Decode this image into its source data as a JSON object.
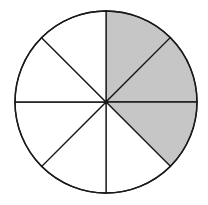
{
  "diagram": {
    "type": "fraction-circle",
    "total_slices": 8,
    "shaded_slices": 3,
    "shaded_indices": [
      0,
      1,
      2
    ],
    "fraction_shown": "3/8",
    "colors": {
      "shaded": "#c6c6c6",
      "unshaded": "#ffffff",
      "stroke": "#1a1a1a"
    },
    "geometry": {
      "cx": 106,
      "cy": 102,
      "r": 91
    }
  }
}
